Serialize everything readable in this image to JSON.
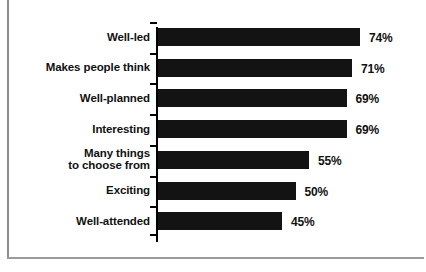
{
  "chart_data": {
    "type": "bar",
    "orientation": "horizontal",
    "title": "",
    "xlabel": "",
    "ylabel": "",
    "xlim": [
      0,
      100
    ],
    "grid": false,
    "legend": null,
    "value_suffix": "%",
    "categories": [
      "Well-led",
      "Makes people think",
      "Well-planned",
      "Interesting",
      "Many things\nto choose from",
      "Exciting",
      "Well-attended"
    ],
    "values": [
      74,
      71,
      69,
      69,
      55,
      50,
      45
    ],
    "value_labels": [
      "74%",
      "71%",
      "69%",
      "69%",
      "55%",
      "50%",
      "45%"
    ],
    "bar_color": "#131313",
    "background_color": "#ffffff",
    "axis_color": "#000000"
  },
  "rows": [
    {
      "label_line1": "Well-led",
      "label_line2": "",
      "value": 74,
      "value_label": "74%"
    },
    {
      "label_line1": "Makes people think",
      "label_line2": "",
      "value": 71,
      "value_label": "71%"
    },
    {
      "label_line1": "Well-planned",
      "label_line2": "",
      "value": 69,
      "value_label": "69%"
    },
    {
      "label_line1": "Interesting",
      "label_line2": "",
      "value": 69,
      "value_label": "69%"
    },
    {
      "label_line1": "Many things",
      "label_line2": "to choose from",
      "value": 55,
      "value_label": "55%"
    },
    {
      "label_line1": "Exciting",
      "label_line2": "",
      "value": 50,
      "value_label": "50%"
    },
    {
      "label_line1": "Well-attended",
      "label_line2": "",
      "value": 45,
      "value_label": "45%"
    }
  ]
}
